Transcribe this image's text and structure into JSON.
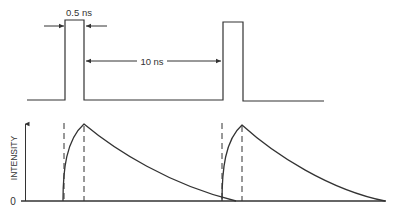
{
  "diagram": {
    "pulse_train": {
      "pulse_width_label": "0.5 ns",
      "period_label": "10 ns",
      "pulse_count": 2
    },
    "intensity_plot": {
      "y_axis_label": "INTENSITY",
      "origin_label": "0",
      "decay_count": 2
    },
    "colors": {
      "line": "#333333",
      "background": "#ffffff"
    }
  }
}
